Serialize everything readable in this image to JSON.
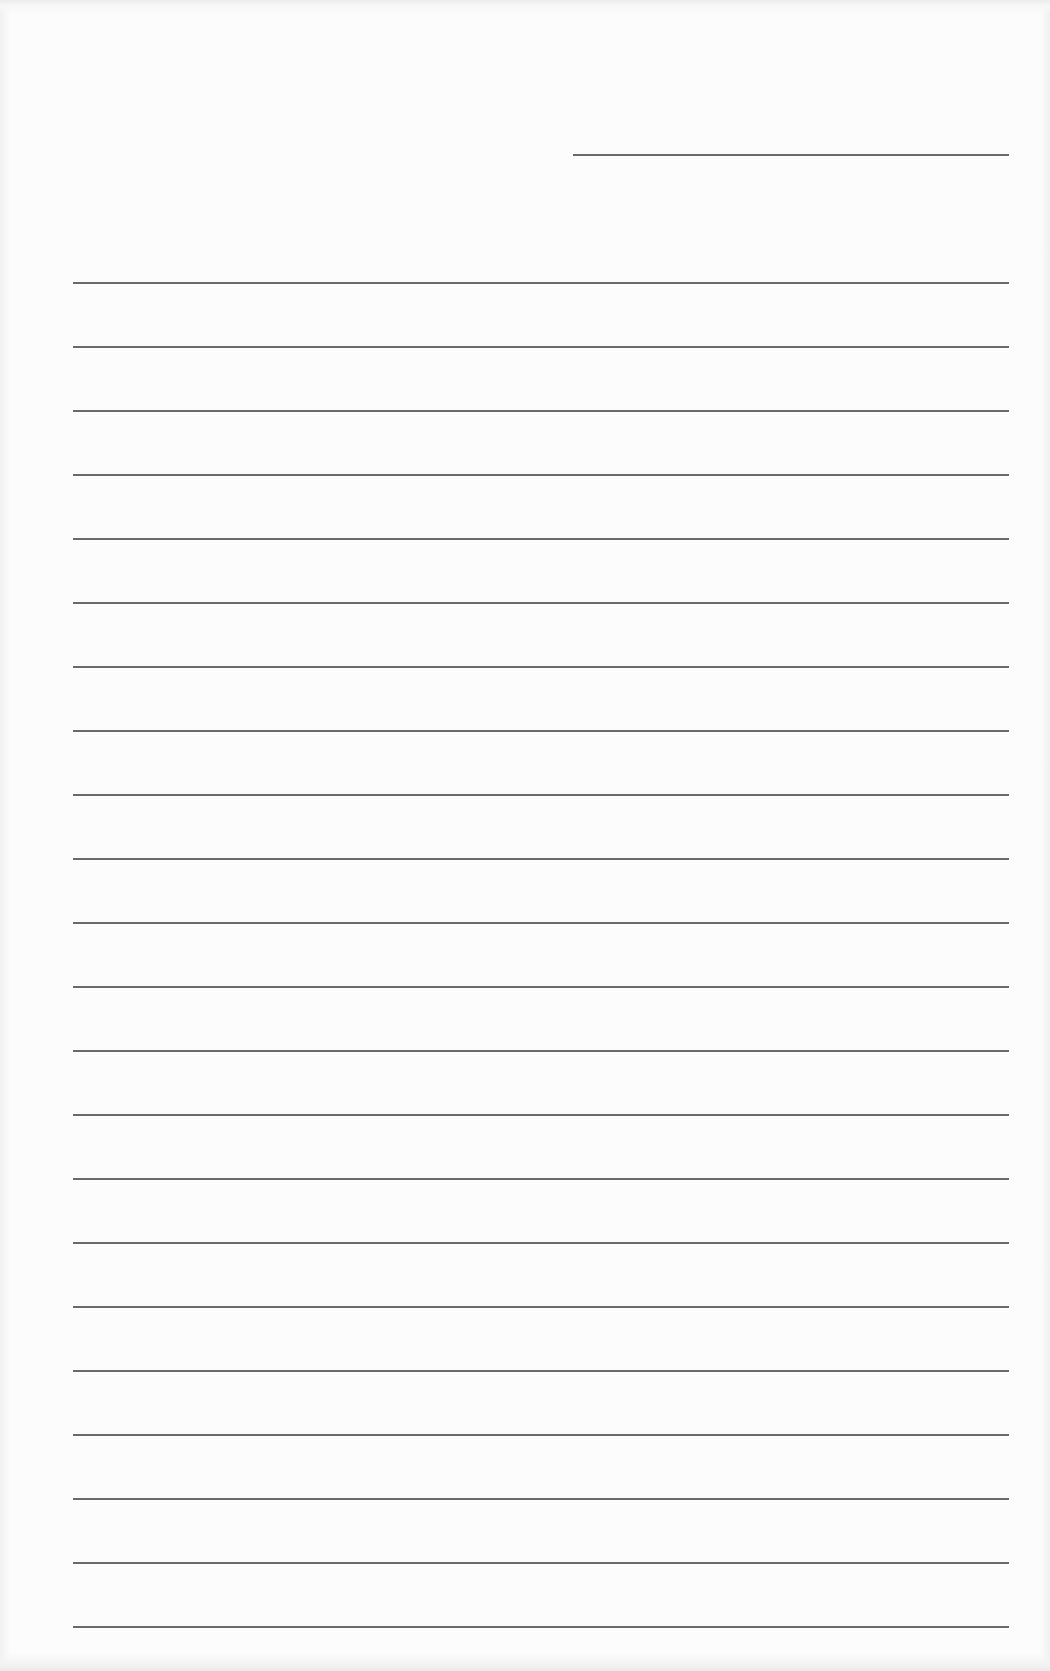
{
  "paper": {
    "type": "lined-writing-paper",
    "background_color": "#fcfcfc",
    "line_color": "#6a6a6a",
    "header_line": {
      "x": 573,
      "y": 154,
      "width": 436
    },
    "ruled_lines": {
      "count": 22,
      "x": 73,
      "width": 936,
      "first_y": 282,
      "spacing": 64
    }
  }
}
